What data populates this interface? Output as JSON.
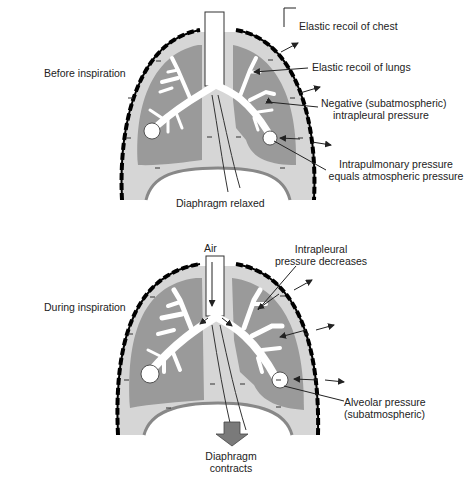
{
  "colors": {
    "chest_wall": "#000000",
    "pleural_space": "#d6d6d6",
    "lung_tissue": "#9a9a9a",
    "airway": "#ffffff",
    "label_text": "#222222"
  },
  "panels": [
    {
      "id": "before",
      "title": "Before inspiration",
      "bottom_label": "Diaphragm relaxed",
      "annotations": [
        {
          "id": "chest-recoil",
          "text": "Elastic recoil of chest"
        },
        {
          "id": "lung-recoil",
          "text": "Elastic recoil of lungs"
        },
        {
          "id": "intrapleural",
          "line1": "Negative (subatmospheric)",
          "line2": "intrapleural pressure"
        },
        {
          "id": "intrapulmonary",
          "line1": "Intrapulmonary pressure",
          "line2": "equals atmospheric pressure"
        }
      ],
      "pressure_marks": "−"
    },
    {
      "id": "during",
      "title": "During inspiration",
      "top_label": "Air",
      "bottom_label_line1": "Diaphragm",
      "bottom_label_line2": "contracts",
      "annotations": [
        {
          "id": "intrapleural-decrease",
          "line1": "Intrapleural",
          "line2": "pressure decreases"
        },
        {
          "id": "alveolar",
          "line1": "Alveolar pressure",
          "line2": "(subatmospheric)"
        }
      ],
      "pressure_marks": "−"
    }
  ]
}
